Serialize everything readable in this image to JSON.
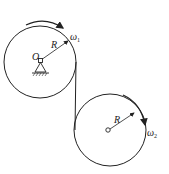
{
  "diagram": {
    "pulley1": {
      "center_label": "O",
      "radius_label": "R",
      "omega_label": "ω",
      "omega_sub": "1"
    },
    "pulley2": {
      "radius_label": "R",
      "omega_label": "ω",
      "omega_sub": "2"
    },
    "colors": {
      "stroke": "#222222",
      "background": "#ffffff"
    }
  }
}
